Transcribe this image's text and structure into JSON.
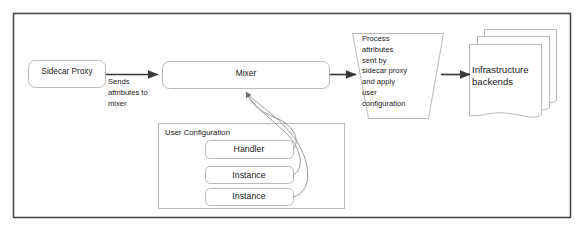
{
  "diagram": {
    "frame": {
      "stroke": "#4a4a4a"
    },
    "colors": {
      "box_stroke": "#b9b9b9",
      "arrow": "#3a3a3a",
      "curve": "#9a9a9a",
      "text": "#1a1a1a",
      "background": "#ffffff"
    },
    "nodes": {
      "sidecar_proxy": {
        "label": "Sidecar Proxy",
        "shape": "rounded-rect"
      },
      "mixer": {
        "label": "Mixer",
        "shape": "rounded-rect"
      },
      "process": {
        "label": "Process\nattributes\nsent by\nsidecar proxy\nand apply\nuser\nconfiguration",
        "shape": "trapezoid"
      },
      "backends": {
        "label": "Infrastructure\nbackends",
        "shape": "stacked-document"
      },
      "user_configuration": {
        "label": "User Configuration",
        "shape": "rect"
      },
      "handler": {
        "label": "Handler",
        "shape": "rounded-rect"
      },
      "instance_1": {
        "label": "Instance",
        "shape": "rounded-rect"
      },
      "instance_2": {
        "label": "Instance",
        "shape": "rounded-rect"
      }
    },
    "edges": {
      "sidecar_to_mixer": {
        "label": "Sends\nattributes to\nmixer",
        "style": "straight-arrow"
      },
      "mixer_to_process": {
        "label": "",
        "style": "straight-arrow"
      },
      "process_to_backends": {
        "label": "",
        "style": "straight-arrow"
      },
      "handler_to_mixer": {
        "label": "",
        "style": "curved-arrow"
      },
      "instance_1_to_mixer": {
        "label": "",
        "style": "curved-arrow"
      },
      "instance_2_to_mixer": {
        "label": "",
        "style": "curved-arrow"
      }
    }
  }
}
